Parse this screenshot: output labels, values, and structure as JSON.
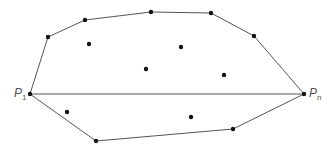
{
  "diagram": {
    "labels": {
      "p1": "P",
      "p1_sub": "1",
      "pn": "P",
      "pn_sub": "n"
    },
    "hull_upper": [
      [
        30,
        94
      ],
      [
        48,
        37
      ],
      [
        85,
        20
      ],
      [
        151,
        12
      ],
      [
        211,
        13
      ],
      [
        254,
        36
      ],
      [
        304,
        94
      ]
    ],
    "hull_lower": [
      [
        30,
        94
      ],
      [
        96,
        141
      ],
      [
        233,
        129
      ],
      [
        304,
        94
      ]
    ],
    "chord": [
      [
        30,
        94
      ],
      [
        304,
        94
      ]
    ],
    "interior_points": [
      [
        89,
        44
      ],
      [
        181,
        47
      ],
      [
        146,
        69
      ],
      [
        224,
        75
      ],
      [
        67,
        112
      ],
      [
        191,
        117
      ]
    ],
    "colors": {
      "line": "#555555",
      "point": "#111111",
      "label": "#555555"
    }
  }
}
